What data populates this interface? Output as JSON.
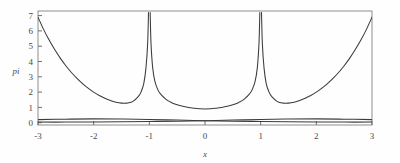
{
  "figure": {
    "background": "#fefefe",
    "frame_color": "#8d8d8d",
    "curve_color": "#3b3b3b",
    "text_color": "#4a4a4a"
  },
  "axes": {
    "x_title": "x",
    "y_title": "pi",
    "x_ticks": [
      "-3",
      "-2",
      "-1",
      "0",
      "1",
      "2",
      "3"
    ],
    "y_ticks": [
      "0",
      "1",
      "2",
      "3",
      "4",
      "5",
      "6",
      "7"
    ]
  },
  "chart_data": {
    "type": "line",
    "title": "",
    "xlabel": "x",
    "ylabel": "pi",
    "xlim": [
      -3.0,
      3.0
    ],
    "ylim": [
      -0.15,
      7.3
    ],
    "grid": false,
    "legend": "none",
    "x_tick_values": [
      -3,
      -2,
      -1,
      0,
      1,
      2,
      3
    ],
    "y_tick_values": [
      0,
      1,
      2,
      3,
      4,
      5,
      6,
      7
    ],
    "notes": [
      "Main curve has vertical asymptotes (poles) at x = -1 and x = +1, clipped at the top frame near y = 7.2",
      "Main curve is symmetric about x = 0 with a local minimum of about 0.90 at x = 0",
      "Main curve rises steeply at the domain edges, reaching about 6.9 at x = -3 and x = +3",
      "A second pair of nearly flat curves forms a shallow X crossing near x = -2 and x = +2 at about y = 0.25",
      "All curves drawn in dark gray on a white field inside a thin gray rectangular frame"
    ],
    "series": [
      {
        "name": "main-curve-left-branch",
        "comment": "x from -3 to -1 (approaches +inf at x=-1)",
        "x": [
          -3.0,
          -2.9,
          -2.8,
          -2.7,
          -2.6,
          -2.5,
          -2.4,
          -2.3,
          -2.2,
          -2.1,
          -2.0,
          -1.9,
          -1.8,
          -1.7,
          -1.6,
          -1.5,
          -1.4,
          -1.3,
          -1.2,
          -1.15,
          -1.1,
          -1.06,
          -1.03,
          -1.015
        ],
        "y": [
          6.9,
          6.1,
          5.4,
          4.78,
          4.22,
          3.72,
          3.28,
          2.9,
          2.56,
          2.26,
          2.0,
          1.78,
          1.6,
          1.45,
          1.34,
          1.28,
          1.28,
          1.38,
          1.7,
          2.0,
          2.55,
          3.6,
          5.2,
          7.2
        ]
      },
      {
        "name": "main-curve-middle-branch",
        "comment": "x from -1 to +1 (approaches +inf at both ends)",
        "x": [
          -0.985,
          -0.97,
          -0.94,
          -0.9,
          -0.85,
          -0.8,
          -0.7,
          -0.6,
          -0.5,
          -0.4,
          -0.3,
          -0.2,
          -0.1,
          0.0,
          0.1,
          0.2,
          0.3,
          0.4,
          0.5,
          0.6,
          0.7,
          0.8,
          0.85,
          0.9,
          0.94,
          0.97,
          0.985
        ],
        "y": [
          7.2,
          5.2,
          3.6,
          2.7,
          2.18,
          1.88,
          1.52,
          1.31,
          1.17,
          1.07,
          1.0,
          0.95,
          0.91,
          0.9,
          0.91,
          0.95,
          1.0,
          1.07,
          1.17,
          1.31,
          1.52,
          1.88,
          2.18,
          2.7,
          3.6,
          5.2,
          7.2
        ]
      },
      {
        "name": "main-curve-right-branch",
        "comment": "x from +1 to +3 (approaches +inf at x=+1)",
        "x": [
          1.015,
          1.03,
          1.06,
          1.1,
          1.15,
          1.2,
          1.3,
          1.4,
          1.5,
          1.6,
          1.7,
          1.8,
          1.9,
          2.0,
          2.1,
          2.2,
          2.3,
          2.4,
          2.5,
          2.6,
          2.7,
          2.8,
          2.9,
          3.0
        ],
        "y": [
          7.2,
          5.2,
          3.6,
          2.55,
          2.0,
          1.7,
          1.38,
          1.28,
          1.28,
          1.34,
          1.45,
          1.6,
          1.78,
          2.0,
          2.26,
          2.56,
          2.9,
          3.28,
          3.72,
          4.22,
          4.78,
          5.4,
          6.1,
          6.9
        ]
      },
      {
        "name": "flat-curve-descending",
        "comment": "shallow curve from about 0.20 at x=-3 down toward 0.03 at x=+3",
        "x": [
          -3.0,
          -2.5,
          -2.0,
          -1.5,
          -1.0,
          -0.5,
          0.0,
          0.5,
          1.0,
          1.5,
          2.0,
          2.5,
          3.0
        ],
        "y": [
          0.2,
          0.23,
          0.25,
          0.24,
          0.21,
          0.17,
          0.13,
          0.1,
          0.08,
          0.06,
          0.05,
          0.04,
          0.04
        ]
      },
      {
        "name": "flat-curve-ascending",
        "comment": "mirror image, crossing the descending curve near x = -2 and x = +2",
        "x": [
          -3.0,
          -2.5,
          -2.0,
          -1.5,
          -1.0,
          -0.5,
          0.0,
          0.5,
          1.0,
          1.5,
          2.0,
          2.5,
          3.0
        ],
        "y": [
          0.04,
          0.04,
          0.05,
          0.06,
          0.08,
          0.1,
          0.13,
          0.17,
          0.21,
          0.24,
          0.25,
          0.23,
          0.2
        ]
      }
    ]
  }
}
